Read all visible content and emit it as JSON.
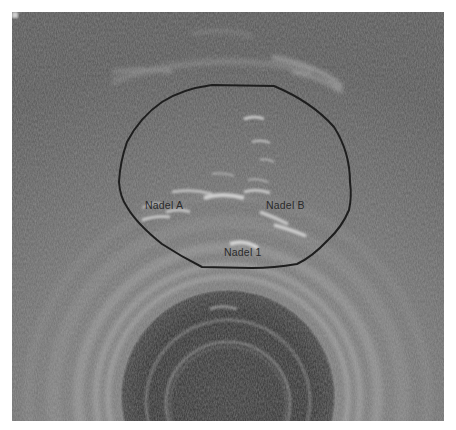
{
  "image": {
    "description": "Transrectal ultrasound image of prostate with outlined contour and needle annotations",
    "colors": {
      "background": "#6e6e6e",
      "outline": "#1e1e1e",
      "label_text": "#2a2a2a",
      "probe_dark": "#3c3c3c"
    }
  },
  "annotations": {
    "labels": [
      {
        "text": "Nadel A",
        "x": 133,
        "y": 197
      },
      {
        "text": "Nadel B",
        "x": 254,
        "y": 197
      },
      {
        "text": "Nadel 1",
        "x": 212,
        "y": 244
      }
    ],
    "contour": {
      "shape": "closed-outline",
      "color": "#1e1e1e"
    }
  }
}
